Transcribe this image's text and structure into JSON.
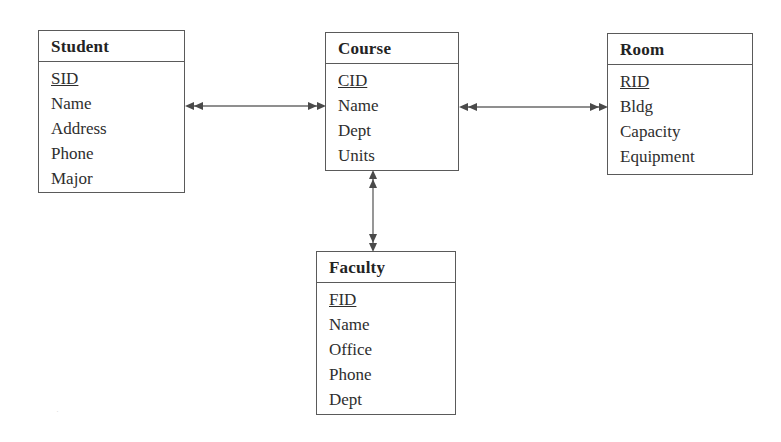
{
  "diagram": {
    "type": "entity-relationship-diagram",
    "background_color": "#ffffff",
    "line_color": "#5a5a5a",
    "text_color": "#2b2b2b",
    "entities": [
      {
        "id": "student",
        "name": "Student",
        "attributes": [
          {
            "label": "SID",
            "key": true
          },
          {
            "label": "Name",
            "key": false
          },
          {
            "label": "Address",
            "key": false
          },
          {
            "label": "Phone",
            "key": false
          },
          {
            "label": "Major",
            "key": false
          }
        ]
      },
      {
        "id": "course",
        "name": "Course",
        "attributes": [
          {
            "label": "CID",
            "key": true
          },
          {
            "label": "Name",
            "key": false
          },
          {
            "label": "Dept",
            "key": false
          },
          {
            "label": "Units",
            "key": false
          }
        ]
      },
      {
        "id": "room",
        "name": "Room",
        "attributes": [
          {
            "label": "RID",
            "key": true
          },
          {
            "label": "Bldg",
            "key": false
          },
          {
            "label": "Capacity",
            "key": false
          },
          {
            "label": "Equipment",
            "key": false
          }
        ]
      },
      {
        "id": "faculty",
        "name": "Faculty",
        "attributes": [
          {
            "label": "FID",
            "key": true
          },
          {
            "label": "Name",
            "key": false
          },
          {
            "label": "Office",
            "key": false
          },
          {
            "label": "Phone",
            "key": false
          },
          {
            "label": "Dept",
            "key": false
          }
        ]
      }
    ],
    "relationships": [
      {
        "id": "student-course",
        "from": "student",
        "to": "course",
        "orientation": "horizontal",
        "cardinality": "many-to-many",
        "arrowheads": "double-both-ends"
      },
      {
        "id": "course-room",
        "from": "course",
        "to": "room",
        "orientation": "horizontal",
        "cardinality": "many-to-many",
        "arrowheads": "double-both-ends"
      },
      {
        "id": "course-faculty",
        "from": "course",
        "to": "faculty",
        "orientation": "vertical",
        "cardinality": "many-to-many",
        "arrowheads": "double-both-ends"
      }
    ]
  },
  "artifacts": {
    "speck": "·"
  }
}
